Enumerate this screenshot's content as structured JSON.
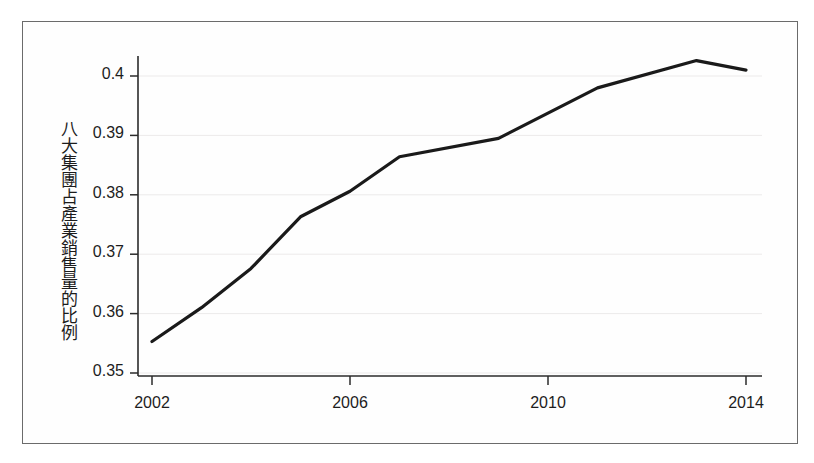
{
  "figure": {
    "border_color": "#6b6b6b",
    "background": "#ffffff"
  },
  "axis": {
    "y_label": "八大集團占產業銷售量的比例",
    "x_label": "",
    "y_ticks": [
      "0.4",
      "0.39",
      "0.38",
      "0.37",
      "0.36",
      "0.35"
    ],
    "x_ticks": [
      "2002",
      "2006",
      "2010",
      "2014"
    ]
  },
  "chart_data": {
    "type": "line",
    "title": "",
    "xlabel": "",
    "ylabel": "八大集團占產業銷售量的比例",
    "xlim": [
      2002,
      2014
    ],
    "ylim": [
      0.35,
      0.405
    ],
    "grid": true,
    "legend": "none",
    "line_color": "#1a1a1a",
    "line_width": 3,
    "x": [
      2002,
      2003,
      2004,
      2005,
      2006,
      2007,
      2009,
      2011,
      2013,
      2014
    ],
    "series": [
      {
        "name": "八大集團占產業銷售量的比例",
        "values": [
          0.3553,
          0.361,
          0.3676,
          0.3763,
          0.3806,
          0.3864,
          0.3895,
          0.398,
          0.4026,
          0.401
        ]
      }
    ],
    "ytick_values": [
      0.4,
      0.39,
      0.38,
      0.37,
      0.36,
      0.35
    ],
    "xtick_values": [
      2002,
      2006,
      2010,
      2014
    ]
  }
}
